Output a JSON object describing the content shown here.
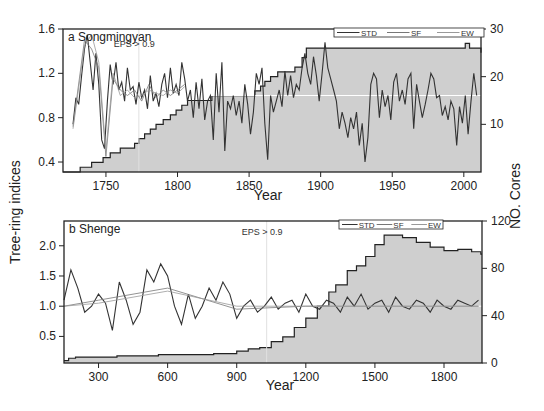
{
  "figure": {
    "shared_ylabel_left": "Tree-ring indices",
    "shared_ylabel_right": "NO. Cores",
    "colors": {
      "fill": "#cfcfcf",
      "std": "#333333",
      "sf": "#777777",
      "ew": "#999999",
      "cores": "#222222",
      "ref": "#ffffff",
      "frame": "#222222"
    }
  },
  "chart_data": [
    {
      "type": "line",
      "panel": "a",
      "title": "a Songmingyan",
      "annotation": "EPS > 0.9",
      "annotation_x": 1773,
      "xlabel": "Year",
      "ylabel": "Tree-ring indices",
      "y2label": "NO. Cores",
      "xlim": [
        1720,
        2012
      ],
      "ylim": [
        0.31,
        1.6
      ],
      "y2lim": [
        0,
        30
      ],
      "xticks": [
        1750,
        1800,
        1850,
        1900,
        1950,
        2000
      ],
      "yticks": [
        0.4,
        0.8,
        1.2,
        1.6
      ],
      "y2ticks": [
        10,
        20,
        30
      ],
      "legend": [
        "STD",
        "SF",
        "EW"
      ],
      "legend_position": "top-right",
      "reference_line": 1.0,
      "series": [
        {
          "name": "STD",
          "x": [
            1727,
            1729,
            1731,
            1733,
            1735,
            1737,
            1739,
            1741,
            1743,
            1745,
            1747,
            1749,
            1751,
            1753,
            1755,
            1757,
            1759,
            1761,
            1763,
            1765,
            1767,
            1769,
            1771,
            1773,
            1775,
            1777,
            1779,
            1781,
            1783,
            1785,
            1787,
            1789,
            1791,
            1793,
            1795,
            1797,
            1799,
            1801,
            1803,
            1805,
            1807,
            1809,
            1811,
            1813,
            1815,
            1817,
            1819,
            1821,
            1823,
            1825,
            1827,
            1829,
            1831,
            1833,
            1835,
            1837,
            1839,
            1841,
            1843,
            1845,
            1847,
            1849,
            1851,
            1853,
            1855,
            1857,
            1859,
            1861,
            1863,
            1865,
            1867,
            1869,
            1871,
            1873,
            1875,
            1877,
            1879,
            1881,
            1883,
            1885,
            1887,
            1889,
            1891,
            1893,
            1895,
            1897,
            1899,
            1901,
            1903,
            1905,
            1907,
            1909,
            1911,
            1913,
            1915,
            1917,
            1919,
            1921,
            1923,
            1925,
            1927,
            1929,
            1931,
            1933,
            1935,
            1937,
            1939,
            1941,
            1943,
            1945,
            1947,
            1949,
            1951,
            1953,
            1955,
            1957,
            1959,
            1961,
            1963,
            1965,
            1967,
            1969,
            1971,
            1973,
            1975,
            1977,
            1979,
            1981,
            1983,
            1985,
            1987,
            1989,
            1991,
            1993,
            1995,
            1997,
            1999,
            2001,
            2003,
            2005,
            2007,
            2009
          ],
          "values": [
            0.74,
            0.98,
            0.92,
            1.18,
            1.42,
            1.55,
            1.3,
            1.05,
            1.38,
            1.1,
            0.6,
            0.52,
            0.95,
            1.28,
            1.1,
            1.3,
            1.05,
            1.12,
            0.95,
            1.25,
            1.05,
            1.08,
            0.92,
            1.12,
            0.98,
            1.05,
            0.88,
            1.18,
            0.95,
            1.02,
            0.9,
            1.1,
            1.2,
            0.98,
            1.25,
            1.02,
            1.1,
            1.0,
            1.3,
            1.15,
            0.95,
            1.05,
            0.8,
            1.12,
            0.88,
            1.15,
            0.78,
            0.95,
            1.0,
            0.6,
            1.2,
            0.85,
            1.3,
            0.5,
            0.95,
            0.88,
            1.0,
            0.82,
            0.95,
            0.75,
            1.1,
            0.92,
            0.65,
            0.85,
            1.2,
            1.1,
            1.25,
            0.75,
            0.42,
            1.0,
            0.85,
            0.95,
            1.05,
            0.9,
            1.22,
            1.0,
            1.18,
            0.98,
            1.1,
            1.05,
            1.25,
            1.38,
            1.2,
            1.1,
            1.35,
            1.18,
            0.95,
            1.2,
            1.48,
            1.25,
            1.15,
            1.05,
            0.95,
            0.7,
            0.85,
            0.75,
            0.62,
            0.8,
            0.7,
            0.85,
            0.55,
            0.75,
            0.4,
            0.62,
            1.1,
            1.2,
            1.15,
            0.8,
            1.05,
            0.9,
            1.0,
            0.78,
            1.12,
            1.2,
            0.95,
            1.05,
            0.92,
            1.15,
            1.2,
            0.7,
            1.1,
            0.95,
            0.8,
            0.92,
            1.05,
            1.2,
            1.15,
            0.98,
            1.0,
            0.82,
            0.9,
            0.78,
            0.95,
            0.88,
            0.55,
            0.9,
            0.75,
            1.0,
            0.65,
            0.95,
            1.2,
            1.0
          ]
        },
        {
          "name": "SF",
          "x": [
            1727,
            1735,
            1740,
            1745,
            1750,
            1755,
            1760,
            1765,
            1770,
            1775,
            1780,
            1785,
            1790,
            1795,
            1800,
            1805
          ],
          "values": [
            0.72,
            1.5,
            1.42,
            1.25,
            0.45,
            1.15,
            1.05,
            1.0,
            1.05,
            0.95,
            1.1,
            0.98,
            1.05,
            1.0,
            1.05,
            1.1
          ]
        },
        {
          "name": "EW",
          "x": [
            1727,
            1735,
            1740,
            1745,
            1750,
            1755,
            1760,
            1765,
            1770,
            1775,
            1780,
            1785,
            1790,
            1795,
            1800,
            1805
          ],
          "values": [
            0.7,
            1.45,
            1.55,
            1.3,
            0.5,
            1.2,
            1.0,
            1.05,
            0.98,
            1.0,
            1.05,
            1.02,
            1.0,
            1.05,
            1.02,
            1.08
          ]
        },
        {
          "name": "NO. Cores",
          "axis": "right",
          "type": "step",
          "x": [
            1720,
            1732,
            1740,
            1748,
            1753,
            1760,
            1770,
            1773,
            1777,
            1781,
            1785,
            1790,
            1795,
            1799,
            1803,
            1807,
            1824,
            1854,
            1858,
            1861,
            1865,
            1870,
            1882,
            1887,
            1890,
            2001,
            2004,
            2012
          ],
          "values": [
            0,
            1,
            2,
            3,
            4,
            5,
            6,
            7,
            8,
            9,
            10,
            11,
            12,
            13,
            14,
            15,
            16,
            17,
            18,
            19,
            20,
            21,
            22,
            24,
            26,
            27,
            26,
            25
          ]
        }
      ]
    },
    {
      "type": "line",
      "panel": "b",
      "title": "b Shenge",
      "annotation": "EPS > 0.9",
      "annotation_x": 1030,
      "xlabel": "Year",
      "ylabel": "Tree-ring indices",
      "y2label": "NO. Cores",
      "xlim": [
        150,
        1965
      ],
      "ylim": [
        0.06,
        2.41
      ],
      "y2lim": [
        0,
        120
      ],
      "xticks": [
        300,
        600,
        900,
        1200,
        1500,
        1800
      ],
      "yticks": [
        0.5,
        1.0,
        1.5,
        2.0
      ],
      "y2ticks": [
        0,
        40,
        80,
        120
      ],
      "legend": [
        "STD",
        "SF",
        "EW"
      ],
      "legend_position": "top-right",
      "reference_line": 1.0,
      "series": [
        {
          "name": "STD",
          "x": [
            150,
            180,
            210,
            240,
            270,
            300,
            330,
            360,
            390,
            420,
            450,
            480,
            510,
            540,
            570,
            600,
            630,
            660,
            690,
            720,
            750,
            780,
            810,
            840,
            870,
            900,
            930,
            960,
            990,
            1020,
            1050,
            1080,
            1110,
            1140,
            1170,
            1200,
            1230,
            1260,
            1290,
            1320,
            1350,
            1380,
            1410,
            1440,
            1470,
            1500,
            1530,
            1560,
            1590,
            1620,
            1650,
            1680,
            1710,
            1740,
            1770,
            1800,
            1830,
            1860,
            1890,
            1920,
            1950
          ],
          "values": [
            1.1,
            1.6,
            1.3,
            0.9,
            1.0,
            1.2,
            1.05,
            0.6,
            1.4,
            1.1,
            0.7,
            0.9,
            1.6,
            1.4,
            1.7,
            1.5,
            1.0,
            0.7,
            1.2,
            0.8,
            1.0,
            1.3,
            1.1,
            1.4,
            1.2,
            0.8,
            1.0,
            1.1,
            0.9,
            1.0,
            1.15,
            0.95,
            1.05,
            1.1,
            0.9,
            1.2,
            1.0,
            0.95,
            1.1,
            1.05,
            0.9,
            1.15,
            1.0,
            1.2,
            0.95,
            1.05,
            1.1,
            0.9,
            1.15,
            1.0,
            0.95,
            1.1,
            1.05,
            0.9,
            1.1,
            1.0,
            0.95,
            1.1,
            1.05,
            1.0,
            1.1
          ]
        },
        {
          "name": "SF",
          "x": [
            150,
            300,
            600,
            900,
            1200,
            1500,
            1800,
            1950
          ],
          "values": [
            1.0,
            1.1,
            1.3,
            0.95,
            1.0,
            1.0,
            1.0,
            1.0
          ]
        },
        {
          "name": "EW",
          "x": [
            150,
            300,
            600,
            900,
            1200,
            1500,
            1800,
            1950
          ],
          "values": [
            1.0,
            1.05,
            1.25,
            1.0,
            1.0,
            1.0,
            1.0,
            1.0
          ]
        },
        {
          "name": "NO. Cores",
          "axis": "right",
          "type": "step",
          "x": [
            150,
            170,
            200,
            380,
            560,
            800,
            900,
            950,
            1000,
            1050,
            1100,
            1150,
            1200,
            1250,
            1300,
            1330,
            1380,
            1420,
            1460,
            1500,
            1540,
            1570,
            1620,
            1680,
            1740,
            1800,
            1860,
            1920,
            1960
          ],
          "values": [
            2,
            4,
            5,
            6,
            7,
            8,
            10,
            12,
            13,
            18,
            22,
            30,
            38,
            48,
            60,
            66,
            78,
            82,
            90,
            100,
            108,
            108,
            106,
            102,
            98,
            95,
            96,
            94,
            92
          ]
        }
      ]
    }
  ]
}
